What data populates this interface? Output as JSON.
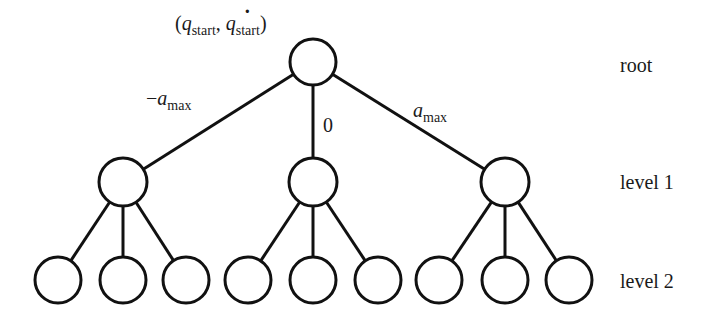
{
  "diagram": {
    "type": "tree",
    "root_label": {
      "open": "(",
      "q": "q",
      "q_sub": "start",
      "sep": ",",
      "qdot": "q",
      "dot": "˙",
      "qdot_sub": "start",
      "close": ")"
    },
    "edge_labels": {
      "left": {
        "prefix": "−",
        "var": "a",
        "sub": "max"
      },
      "middle": {
        "text": "0"
      },
      "right": {
        "var": "a",
        "sub": "max"
      }
    },
    "level_labels": {
      "root": "root",
      "level1": "level 1",
      "level2": "level 2"
    },
    "nodes": {
      "root": {
        "cx": 313,
        "cy": 62,
        "r": 23
      },
      "level1": [
        {
          "cx": 123,
          "cy": 182,
          "r": 24
        },
        {
          "cx": 313,
          "cy": 182,
          "r": 24
        },
        {
          "cx": 505,
          "cy": 182,
          "r": 24
        }
      ],
      "level2": [
        {
          "cx": 58,
          "cy": 280,
          "r": 23,
          "parent": 0
        },
        {
          "cx": 123,
          "cy": 280,
          "r": 23,
          "parent": 0
        },
        {
          "cx": 186,
          "cy": 280,
          "r": 23,
          "parent": 0
        },
        {
          "cx": 248,
          "cy": 280,
          "r": 23,
          "parent": 1
        },
        {
          "cx": 313,
          "cy": 280,
          "r": 23,
          "parent": 1
        },
        {
          "cx": 378,
          "cy": 280,
          "r": 23,
          "parent": 1
        },
        {
          "cx": 439,
          "cy": 280,
          "r": 23,
          "parent": 2
        },
        {
          "cx": 505,
          "cy": 280,
          "r": 23,
          "parent": 2
        },
        {
          "cx": 569,
          "cy": 280,
          "r": 23,
          "parent": 2
        }
      ]
    },
    "colors": {
      "stroke": "#111111",
      "background": "#ffffff",
      "text": "#1a1a1a"
    }
  }
}
